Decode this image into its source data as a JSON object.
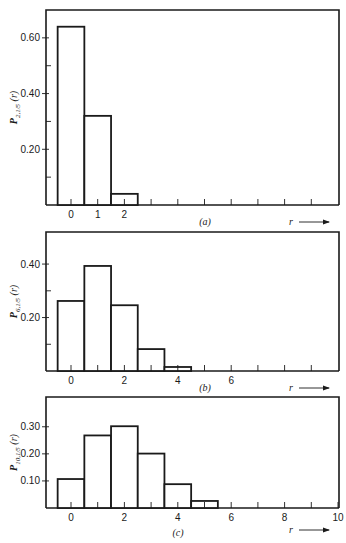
{
  "chart_data": [
    {
      "id": "a",
      "type": "bar",
      "title": "",
      "caption": "(a)",
      "ylabel_main": "P",
      "ylabel_sub": "2,1/5",
      "ylabel_arg": "(r)",
      "xlabel": "r",
      "categories": [
        0,
        1,
        2
      ],
      "values": [
        0.64,
        0.32,
        0.04
      ],
      "yticks_labeled": [
        0.2,
        0.4,
        0.6
      ],
      "yticks_minor": [
        0.1,
        0.3,
        0.5
      ],
      "ytick_labels": [
        "0.20",
        "0.40",
        "0.60"
      ],
      "xtick_labels": [
        "0",
        "1",
        "2"
      ],
      "xticks_labeled": [
        0,
        1,
        2
      ],
      "xticks_all": [
        0,
        1,
        2,
        3,
        4,
        5,
        6,
        7,
        8,
        9
      ],
      "ylim": [
        0,
        0.7
      ],
      "xlim": [
        -0.9,
        9.9
      ],
      "frame": {
        "x": 46,
        "y": 10,
        "w": 293,
        "h": 195
      },
      "caption_x": 205,
      "grid": false
    },
    {
      "id": "b",
      "type": "bar",
      "title": "",
      "caption": "(b)",
      "ylabel_main": "P",
      "ylabel_sub": "6,1/5",
      "ylabel_arg": "(r)",
      "xlabel": "r",
      "categories": [
        0,
        1,
        2,
        3,
        4
      ],
      "values": [
        0.262,
        0.393,
        0.246,
        0.082,
        0.015
      ],
      "yticks_labeled": [
        0.2,
        0.4
      ],
      "yticks_minor": [
        0.1,
        0.3
      ],
      "ytick_labels": [
        "0.20",
        "0.40"
      ],
      "xtick_labels": [
        "0",
        "2",
        "4",
        "6"
      ],
      "xticks_labeled": [
        0,
        2,
        4,
        6
      ],
      "xticks_all": [
        0,
        1,
        2,
        3,
        4,
        5,
        6,
        7,
        8,
        9
      ],
      "ylim": [
        0,
        0.52
      ],
      "xlim": [
        -0.9,
        9.9
      ],
      "frame": {
        "x": 46,
        "y": 232,
        "w": 293,
        "h": 139
      },
      "caption_x": 205,
      "grid": false
    },
    {
      "id": "c",
      "type": "bar",
      "title": "",
      "caption": "(c)",
      "ylabel_main": "P",
      "ylabel_sub": "10,1/5",
      "ylabel_arg": "(r)",
      "xlabel": "r",
      "categories": [
        0,
        1,
        2,
        3,
        4,
        5
      ],
      "values": [
        0.107,
        0.268,
        0.302,
        0.201,
        0.088,
        0.026
      ],
      "yticks_labeled": [
        0.1,
        0.2,
        0.3
      ],
      "yticks_minor": [],
      "ytick_labels": [
        "0.10",
        "0.20",
        "0.30"
      ],
      "xtick_labels": [
        "0",
        "2",
        "4",
        "6",
        "8",
        "10"
      ],
      "xticks_labeled": [
        0,
        2,
        4,
        6,
        8,
        10
      ],
      "xticks_all": [
        0,
        1,
        2,
        3,
        4,
        5,
        6,
        7,
        8,
        9,
        10
      ],
      "ylim": [
        0,
        0.41
      ],
      "xlim": [
        -0.9,
        9.9
      ],
      "frame": {
        "x": 46,
        "y": 397,
        "w": 293,
        "h": 111
      },
      "caption_x": 178,
      "grid": false
    }
  ],
  "layout": {
    "x0_px": 71,
    "x_unit_px": 26.7
  }
}
